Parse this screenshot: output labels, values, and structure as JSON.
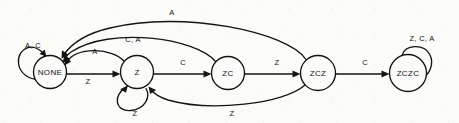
{
  "diagram": {
    "kind": "state-machine",
    "title": "",
    "background_color": "#fbfbf9",
    "ink_color": "#15140f",
    "nodes": [
      {
        "id": "NONE",
        "label": "NONE",
        "cx": 50,
        "cy": 72,
        "r": 16.5
      },
      {
        "id": "Z",
        "label": "Z",
        "cx": 137,
        "cy": 72,
        "r": 16.5
      },
      {
        "id": "ZC",
        "label": "ZC",
        "cx": 228,
        "cy": 73,
        "r": 16.5
      },
      {
        "id": "ZCZ",
        "label": "ZCZ",
        "cx": 318,
        "cy": 73,
        "r": 17.5
      },
      {
        "id": "ZCZC",
        "label": "ZCZC",
        "cx": 408,
        "cy": 73,
        "r": 18.5
      }
    ],
    "edges": [
      {
        "id": "none-self",
        "from": "NONE",
        "to": "NONE",
        "label": "A, C",
        "label_x": 33,
        "label_y": 46
      },
      {
        "id": "none-z",
        "from": "NONE",
        "to": "Z",
        "label": "Z",
        "label_x": 88,
        "label_y": 82
      },
      {
        "id": "z-none",
        "from": "Z",
        "to": "NONE",
        "label": "A",
        "label_x": 95,
        "label_y": 52
      },
      {
        "id": "z-self",
        "from": "Z",
        "to": "Z",
        "label": "Z",
        "label_x": 135,
        "label_y": 114
      },
      {
        "id": "z-zc",
        "from": "Z",
        "to": "ZC",
        "label": "C",
        "label_x": 183,
        "label_y": 63
      },
      {
        "id": "zc-none",
        "from": "ZC",
        "to": "NONE",
        "label": "C, A",
        "label_x": 133,
        "label_y": 40
      },
      {
        "id": "zc-zcz",
        "from": "ZC",
        "to": "ZCZ",
        "label": "Z",
        "label_x": 277,
        "label_y": 63
      },
      {
        "id": "zcz-none",
        "from": "ZCZ",
        "to": "NONE",
        "label": "A",
        "label_x": 172,
        "label_y": 13
      },
      {
        "id": "zcz-z",
        "from": "ZCZ",
        "to": "Z",
        "label": "Z",
        "label_x": 232,
        "label_y": 114
      },
      {
        "id": "zcz-zczc",
        "from": "ZCZ",
        "to": "ZCZC",
        "label": "C",
        "label_x": 365,
        "label_y": 63
      },
      {
        "id": "zczc-self",
        "from": "ZCZC",
        "to": "ZCZC",
        "label": "Z, C, A",
        "label_x": 422,
        "label_y": 39
      }
    ]
  }
}
